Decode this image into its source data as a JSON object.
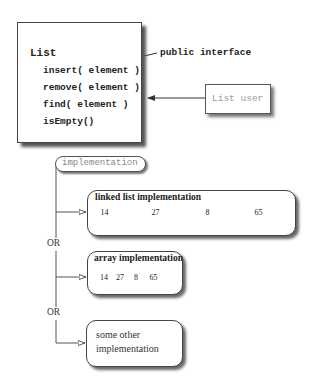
{
  "interface_box": {
    "title": "List",
    "methods": [
      "insert( element )",
      "remove( element )",
      "find( element )",
      "isEmpty()"
    ]
  },
  "annotation": {
    "label": "public interface"
  },
  "client": {
    "label": "List user"
  },
  "implementation_pill": {
    "label": "implementation"
  },
  "alternatives": {
    "or_labels": [
      "OR",
      "OR"
    ],
    "linked_list": {
      "title": "linked list implementation",
      "nodes": [
        "14",
        "27",
        "8",
        "65"
      ]
    },
    "array": {
      "title": "array implementation",
      "cells": [
        "14",
        "27",
        "8",
        "65"
      ]
    },
    "other": {
      "line1": "some other",
      "line2": "implementation"
    }
  }
}
